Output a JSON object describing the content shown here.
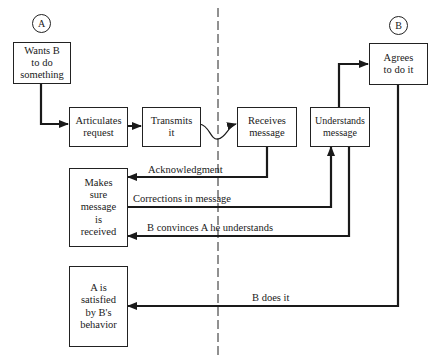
{
  "actors": {
    "a": {
      "label": "A"
    },
    "b": {
      "label": "B"
    }
  },
  "nodes": {
    "wants": {
      "text": "Wants B\nto do\nsomething"
    },
    "articulates": {
      "text": "Articulates\nrequest"
    },
    "transmits": {
      "text": "Transmits\nit"
    },
    "receives": {
      "text": "Receives\nmessage"
    },
    "understands": {
      "text": "Understands\nmessage"
    },
    "agrees": {
      "text": "Agrees\nto do it"
    },
    "makes_sure": {
      "text": "Makes\nsure\nmessage\nis\nreceived"
    },
    "satisfied": {
      "text": "A is\nsatisfied\nby B's\nbehavior"
    }
  },
  "edges": {
    "acknowledgment": {
      "label": "Acknowledgment"
    },
    "corrections": {
      "label": "Corrections in message"
    },
    "convinces": {
      "label": "B convinces A he understands"
    },
    "does_it": {
      "label": "B does it"
    }
  },
  "colors": {
    "line": "#1a1a1a",
    "background": "#ffffff"
  }
}
